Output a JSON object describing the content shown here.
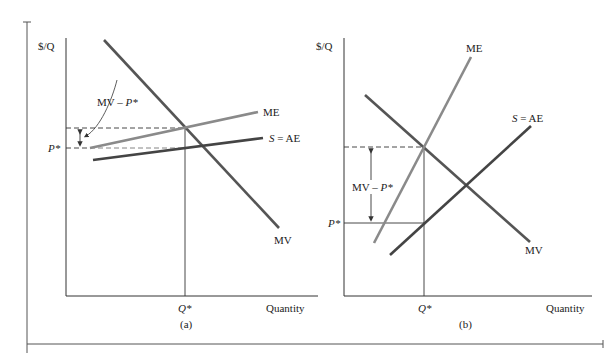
{
  "colors": {
    "axis": "#333333",
    "mv": "#555555",
    "me": "#8a8a8a",
    "s_ae": "#444444",
    "dashed": "#333333"
  },
  "panel_a": {
    "y_axis_label": "$/Q",
    "x_axis_label": "Quantity",
    "q_star_label": "Q*",
    "p_star_label": "P*",
    "caption": "(a)",
    "mv_label": "MV",
    "me_label": "ME",
    "s_label_italic": "S",
    "s_label_rest": " = AE",
    "gap_label_a": "MV – ",
    "gap_label_b": "P*"
  },
  "panel_b": {
    "y_axis_label": "$/Q",
    "x_axis_label": "Quantity",
    "q_star_label": "Q*",
    "p_star_label": "P*",
    "caption": "(b)",
    "mv_label": "MV",
    "me_label": "ME",
    "s_label_italic": "S",
    "s_label_rest": " = AE",
    "gap_label_a": "MV – ",
    "gap_label_b": "P*"
  }
}
